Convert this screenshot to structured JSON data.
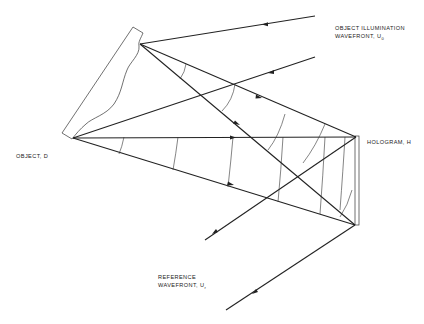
{
  "labels": {
    "object_illumination_line1": "OBJECT ILLUMINATION",
    "object_illumination_line2": "WAVEFRONT, U",
    "object_illumination_sub": "0",
    "object": "OBJECT, D",
    "hologram": "HOLOGRAM, H",
    "reference_line1": "REFERENCE",
    "reference_line2": "WAVEFRONT, U",
    "reference_sub": "r"
  },
  "colors": {
    "line": "#222222",
    "background": "#ffffff"
  }
}
